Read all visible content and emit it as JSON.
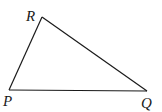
{
  "diagram": {
    "type": "triangle",
    "stroke_color": "#1a1a1a",
    "vertices": [
      {
        "name": "P",
        "x": 9,
        "y": 90,
        "label_x": 3,
        "label_y": 106
      },
      {
        "name": "Q",
        "x": 147,
        "y": 91,
        "label_x": 141,
        "label_y": 108
      },
      {
        "name": "R",
        "x": 42,
        "y": 17,
        "label_x": 26,
        "label_y": 21
      }
    ],
    "labels": {
      "P": "P",
      "Q": "Q",
      "R": "R"
    }
  }
}
